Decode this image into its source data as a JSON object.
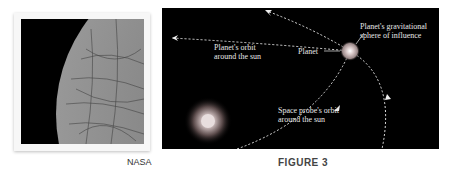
{
  "photo": {
    "subject": "planet-surface-photo",
    "credit": "NASA"
  },
  "figure": {
    "caption": "FIGURE 3",
    "labels": {
      "planet_orbit_line1": "Planet's orbit",
      "planet_orbit_line2": "around the sun",
      "planet": "Planet",
      "sphere_line1": "Planet's gravitational",
      "sphere_line2": "sphere of influence",
      "probe_orbit_line1": "Space probe's orbit",
      "probe_orbit_line2": "around the sun"
    },
    "colors": {
      "background": "#000000",
      "orbit_lines": "#dddddd",
      "sun": "#e8e0e0",
      "planet_sphere": "#b8a8a8"
    }
  }
}
